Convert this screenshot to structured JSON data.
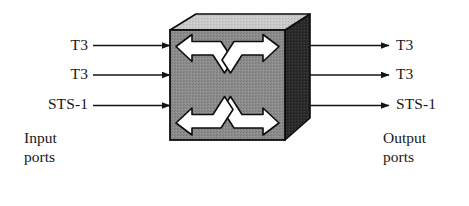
{
  "diagram": {
    "device": {
      "name": "cross-connect-box",
      "symbol": "crossed-double-arrows",
      "faces": {
        "front_color": "#8c8c8c",
        "top_color": "#c9c9c9",
        "side_color": "#2b2b2b",
        "outline_color": "#0d0d0d",
        "symbol_color": "#ffffff"
      }
    },
    "input_ports": {
      "caption_line_1": "Input",
      "caption_line_2": "ports",
      "signals": [
        {
          "label": "T3"
        },
        {
          "label": "T3"
        },
        {
          "label": "STS-1"
        }
      ]
    },
    "output_ports": {
      "caption_line_1": "Output",
      "caption_line_2": "ports",
      "signals": [
        {
          "label": "T3"
        },
        {
          "label": "T3"
        },
        {
          "label": "STS-1"
        }
      ]
    },
    "arrows": {
      "line_color": "#141414",
      "input_direction": "right",
      "output_direction": "right"
    }
  }
}
